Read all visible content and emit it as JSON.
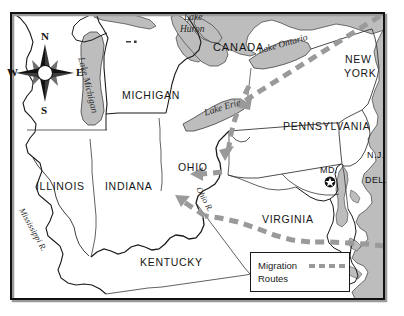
{
  "map": {
    "title": "Migration Routes Map of the Eastern United States",
    "frame": {
      "x": 10,
      "y": 12,
      "width": 375,
      "height": 288
    },
    "colors": {
      "water": "#b9b9b9",
      "water_outline": "#4a4a4a",
      "land": "#ffffff",
      "border": "#1a1a1a",
      "state_line": "#3a3a3a",
      "route": "#8c8c8c",
      "frame": "#111111"
    },
    "country_labels": [
      {
        "name": "canada",
        "text": "CANADA",
        "x": 213,
        "y": 41
      }
    ],
    "state_labels": [
      {
        "name": "michigan",
        "text": "MICHIGAN",
        "x": 122,
        "y": 89
      },
      {
        "name": "new-york",
        "text": "NEW",
        "x": 345,
        "y": 53
      },
      {
        "name": "new-york-2",
        "text": "YORK",
        "x": 344,
        "y": 67
      },
      {
        "name": "pennsylvania",
        "text": "PENNSYLVANIA",
        "x": 283,
        "y": 120
      },
      {
        "name": "new-jersey",
        "text": "N.J.",
        "x": 367,
        "y": 150
      },
      {
        "name": "ohio",
        "text": "OHIO",
        "x": 178,
        "y": 161
      },
      {
        "name": "illinois",
        "text": "ILLINOIS",
        "x": 36,
        "y": 180
      },
      {
        "name": "indiana",
        "text": "INDIANA",
        "x": 105,
        "y": 180
      },
      {
        "name": "maryland",
        "text": "MD.",
        "x": 320,
        "y": 165
      },
      {
        "name": "delaware",
        "text": "DEL.",
        "x": 365,
        "y": 175
      },
      {
        "name": "virginia",
        "text": "VIRGINIA",
        "x": 262,
        "y": 213
      },
      {
        "name": "kentucky",
        "text": "KENTUCKY",
        "x": 140,
        "y": 256
      }
    ],
    "water_labels": [
      {
        "name": "lake-huron",
        "text": "Lake",
        "x": 184,
        "y": 12,
        "rotate": 0
      },
      {
        "name": "lake-huron-2",
        "text": "Huron",
        "x": 180,
        "y": 24,
        "rotate": 0
      },
      {
        "name": "lake-ontario",
        "text": "Lake Ontario",
        "x": 257,
        "y": 46,
        "rotate": -16
      },
      {
        "name": "lake-erie",
        "text": "Lake Erie",
        "x": 203,
        "y": 108,
        "rotate": -17
      },
      {
        "name": "lake-michigan",
        "text": "Lake Michigan",
        "x": 86,
        "y": 56,
        "rotate": 76
      }
    ],
    "river_labels": [
      {
        "name": "mississippi-river",
        "text": "Mississippi R.",
        "x": 26,
        "y": 206,
        "rotate": 61
      },
      {
        "name": "ohio-river",
        "text": "Ohio R.",
        "x": 203,
        "y": 185,
        "rotate": 62
      }
    ],
    "compass": {
      "center_x": 45,
      "center_y": 73,
      "north": "N",
      "east": "E",
      "south": "S",
      "west": "W"
    },
    "capital_marker": {
      "name": "washington-dc-star",
      "x": 330,
      "y": 182
    },
    "legend": {
      "line1": "Migration",
      "line2": "Routes"
    },
    "routes": [
      {
        "name": "northeast-route",
        "description": "dashed route from New York southwest across Pennsylvania into Ohio"
      },
      {
        "name": "ohio-river-route",
        "description": "dashed route along the Ohio River valley"
      },
      {
        "name": "virginia-route",
        "description": "dashed route from Virginia northwest into Kentucky and Ohio"
      }
    ]
  }
}
